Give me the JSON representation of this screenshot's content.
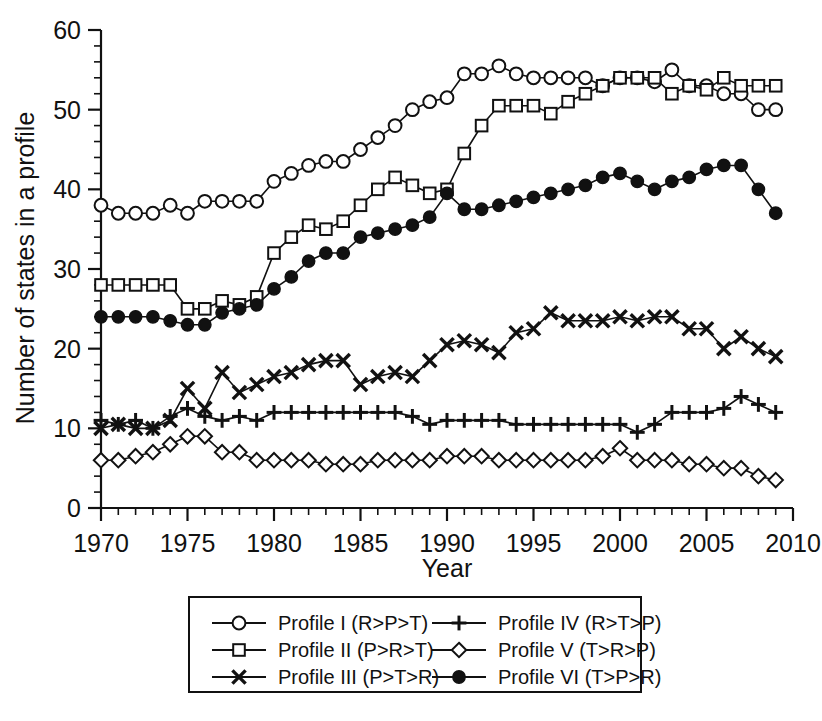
{
  "chart_data": {
    "type": "line",
    "title": "",
    "xlabel": "Year",
    "ylabel": "Number of states in a profile",
    "xlim": [
      1970,
      2010
    ],
    "ylim": [
      0,
      60
    ],
    "xticks": [
      1970,
      1975,
      1980,
      1985,
      1990,
      1995,
      2000,
      2005,
      2010
    ],
    "yticks": [
      0,
      10,
      20,
      30,
      40,
      50,
      60
    ],
    "x_minor_step": 1,
    "y_minor_step": 2,
    "grid": false,
    "legend_position": "bottom",
    "x": [
      1970,
      1971,
      1972,
      1973,
      1974,
      1975,
      1976,
      1977,
      1978,
      1979,
      1980,
      1981,
      1982,
      1983,
      1984,
      1985,
      1986,
      1987,
      1988,
      1989,
      1990,
      1991,
      1992,
      1993,
      1994,
      1995,
      1996,
      1997,
      1998,
      1999,
      2000,
      2001,
      2002,
      2003,
      2004,
      2005,
      2006,
      2007,
      2008,
      2009
    ],
    "series": [
      {
        "name": "Profile I (R>P>T)",
        "marker": "open-circle",
        "values": [
          38,
          37,
          37,
          37,
          38,
          37,
          38.5,
          38.5,
          38.5,
          38.5,
          41,
          42,
          43,
          43.5,
          43.5,
          45,
          46.5,
          48,
          50,
          51,
          51.5,
          54.5,
          54.5,
          55.5,
          54.5,
          54,
          54,
          54,
          54,
          53,
          54,
          54,
          53.5,
          55,
          53,
          53,
          52,
          52,
          50,
          50
        ]
      },
      {
        "name": "Profile II (P>R>T)",
        "marker": "open-square",
        "values": [
          28,
          28,
          28,
          28,
          28,
          25,
          25,
          26,
          25.5,
          26.5,
          32,
          34,
          35.5,
          35,
          36,
          38,
          40,
          41.5,
          40.5,
          39.5,
          40,
          44.5,
          48,
          50.5,
          50.5,
          50.5,
          49.5,
          51,
          52,
          53,
          54,
          54,
          54,
          52,
          53,
          52.5,
          54,
          53,
          53,
          53
        ]
      },
      {
        "name": "Profile III (P>T>R)",
        "marker": "cross",
        "values": [
          10,
          10.5,
          10,
          10,
          11,
          15,
          12.5,
          17,
          14.5,
          15.5,
          16.5,
          17,
          18,
          18.5,
          18.5,
          15.5,
          16.5,
          17,
          16.5,
          18.5,
          20.5,
          21,
          20.5,
          19.5,
          22,
          22.5,
          24.5,
          23.5,
          23.5,
          23.5,
          24,
          23.5,
          24,
          24,
          22.5,
          22.5,
          20,
          21.5,
          20,
          19
        ]
      },
      {
        "name": "Profile IV (R>T>P)",
        "marker": "plus",
        "values": [
          11,
          10.5,
          11,
          10,
          11.5,
          12.5,
          11.5,
          11,
          11.5,
          11,
          12,
          12,
          12,
          12,
          12,
          12,
          12,
          12,
          11.5,
          10.5,
          11,
          11,
          11,
          11,
          10.5,
          10.5,
          10.5,
          10.5,
          10.5,
          10.5,
          10.5,
          9.5,
          10.5,
          12,
          12,
          12,
          12.5,
          14,
          13,
          12
        ]
      },
      {
        "name": "Profile V (T>R>P)",
        "marker": "open-diamond",
        "values": [
          6,
          6,
          6.5,
          7,
          8,
          9,
          9,
          7,
          7,
          6,
          6,
          6,
          6,
          5.5,
          5.5,
          5.5,
          6,
          6,
          6,
          6,
          6.5,
          6.5,
          6.5,
          6,
          6,
          6,
          6,
          6,
          6,
          6.5,
          7.5,
          6,
          6,
          6,
          5.5,
          5.5,
          5,
          5,
          4,
          3.5
        ]
      },
      {
        "name": "Profile VI (T>P>R)",
        "marker": "solid-circle",
        "values": [
          24,
          24,
          24,
          24,
          23.5,
          23,
          23,
          24.5,
          25,
          25.5,
          27.5,
          29,
          31,
          32,
          32,
          34,
          34.5,
          35,
          35.5,
          36.5,
          39.5,
          37.5,
          37.5,
          38,
          38.5,
          39,
          39.5,
          40,
          40.5,
          41.5,
          42,
          41,
          40,
          41,
          41.5,
          42.5,
          43,
          43,
          40,
          37
        ]
      }
    ]
  },
  "axis": {
    "y_title": "Number of states in a profile",
    "x_title": "Year",
    "x_tick_labels": [
      "1970",
      "1975",
      "1980",
      "1985",
      "1990",
      "1995",
      "2000",
      "2005",
      "2010"
    ],
    "y_tick_labels": [
      "0",
      "10",
      "20",
      "30",
      "40",
      "50",
      "60"
    ]
  },
  "legend": {
    "entries": [
      {
        "label": "Profile I (R>P>T)",
        "marker": "open-circle"
      },
      {
        "label": "Profile II (P>R>T)",
        "marker": "open-square"
      },
      {
        "label": "Profile III (P>T>R)",
        "marker": "cross"
      },
      {
        "label": "Profile IV (R>T>P)",
        "marker": "plus"
      },
      {
        "label": "Profile V (T>R>P)",
        "marker": "open-diamond"
      },
      {
        "label": "Profile VI (T>P>R)",
        "marker": "solid-circle"
      }
    ]
  },
  "colors": {
    "ink": "#111111",
    "background": "#ffffff"
  }
}
